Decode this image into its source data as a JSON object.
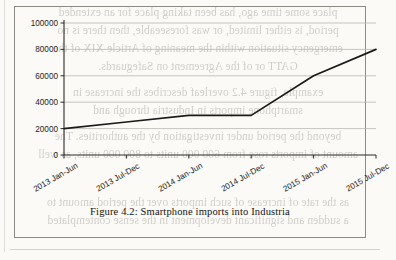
{
  "figure": {
    "caption": "Figure 4.2:  Smartphone imports into Industria",
    "frame_border_color": "#8d8a84"
  },
  "chart_data": {
    "type": "line",
    "title": "",
    "xlabel": "",
    "ylabel": "",
    "categories": [
      "2013 Jan-Jun",
      "2013 Jul-Dec",
      "2014 Jan-Jun",
      "2014 Jul-Dec",
      "2015 Jan-Jun",
      "2015 Jul-Dec"
    ],
    "values": [
      20000,
      25000,
      30000,
      30000,
      60000,
      80000
    ],
    "ylim": [
      0,
      100000
    ],
    "yticks": [
      0,
      20000,
      40000,
      60000,
      80000,
      100000
    ],
    "ytick_labels": [
      "0",
      "20000",
      "40000",
      "60000",
      "80000",
      "100000"
    ],
    "grid": true,
    "grid_axis": "y",
    "legend": false,
    "legend_position": "none",
    "line_color": "#1a1a1a",
    "grid_color": "#b9b6b0",
    "axis_color": "#2b2b2b",
    "xtick_label_rotation": -30
  },
  "scan_showthrough": {
    "lines": [
      "place some time ago, has been taking place for an extended",
      "period, is either limited, or was foreseeable, then there is no",
      "emergency situation within the meaning of Article XIX of the",
      "GATT or of the Agreement on Safeguards.",
      "example, figure 4.2 overleaf describes the increase in",
      "smartphone imports in Industria through and",
      "beyond the period under investigation by the authorities. The",
      "amount of imports rose from 600 000 units to 800 000 units, as well",
      "as the rate of increase of such imports over the period amount to",
      "a sudden and significant development in the sense contemplated"
    ]
  }
}
